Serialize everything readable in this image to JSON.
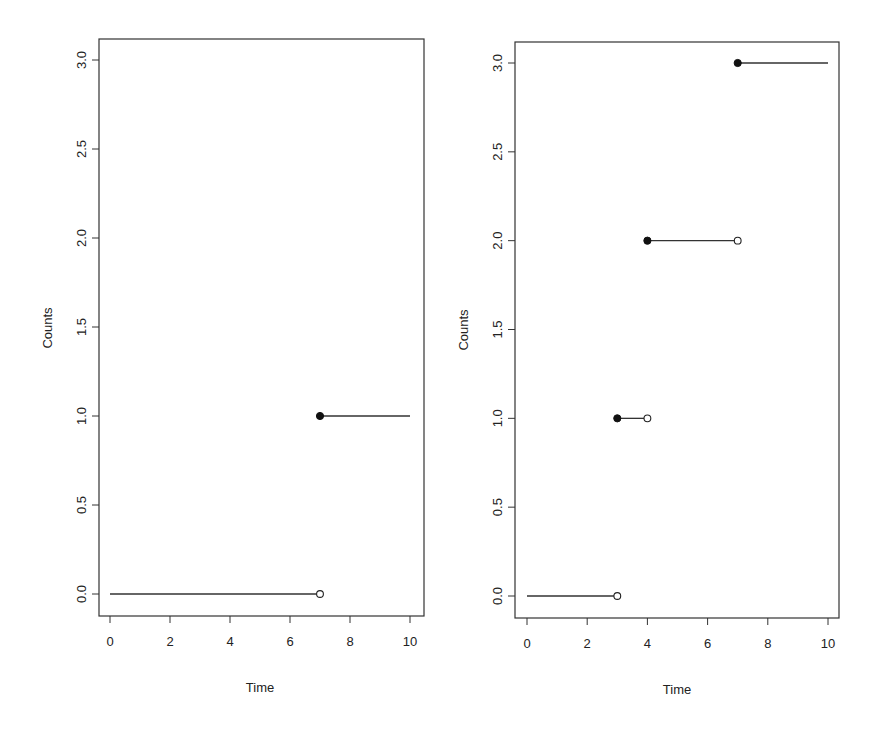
{
  "chart_data": [
    {
      "type": "line",
      "subtype": "step-function (counting process)",
      "title": "",
      "xlabel": "Time",
      "ylabel": "Counts",
      "xlim": [
        0,
        10
      ],
      "ylim": [
        0,
        3
      ],
      "x_ticks": [
        "0",
        "2",
        "4",
        "6",
        "8",
        "10"
      ],
      "y_ticks": [
        "0.0",
        "0.5",
        "1.0",
        "1.5",
        "2.0",
        "2.5",
        "3.0"
      ],
      "grid": false,
      "legend": null,
      "segments": [
        {
          "x_start": 0,
          "x_end": 7,
          "y": 0,
          "start_marker": "none",
          "end_marker": "open"
        },
        {
          "x_start": 7,
          "x_end": 10,
          "y": 1,
          "start_marker": "filled",
          "end_marker": "none"
        }
      ]
    },
    {
      "type": "line",
      "subtype": "step-function (counting process)",
      "title": "",
      "xlabel": "Time",
      "ylabel": "Counts",
      "xlim": [
        0,
        10
      ],
      "ylim": [
        0,
        3
      ],
      "x_ticks": [
        "0",
        "2",
        "4",
        "6",
        "8",
        "10"
      ],
      "y_ticks": [
        "0.0",
        "0.5",
        "1.0",
        "1.5",
        "2.0",
        "2.5",
        "3.0"
      ],
      "grid": false,
      "legend": null,
      "segments": [
        {
          "x_start": 0,
          "x_end": 3,
          "y": 0,
          "start_marker": "none",
          "end_marker": "open"
        },
        {
          "x_start": 3,
          "x_end": 4,
          "y": 1,
          "start_marker": "filled",
          "end_marker": "open"
        },
        {
          "x_start": 4,
          "x_end": 7,
          "y": 2,
          "start_marker": "filled",
          "end_marker": "open"
        },
        {
          "x_start": 7,
          "x_end": 10,
          "y": 3,
          "start_marker": "filled",
          "end_marker": "none"
        }
      ]
    }
  ],
  "panels": [
    {
      "xlabel": "Time",
      "ylabel": "Counts",
      "x_ticks": [
        "0",
        "2",
        "4",
        "6",
        "8",
        "10"
      ],
      "y_ticks": [
        "0.0",
        "0.5",
        "1.0",
        "1.5",
        "2.0",
        "2.5",
        "3.0"
      ]
    },
    {
      "xlabel": "Time",
      "ylabel": "Counts",
      "x_ticks": [
        "0",
        "2",
        "4",
        "6",
        "8",
        "10"
      ],
      "y_ticks": [
        "0.0",
        "0.5",
        "1.0",
        "1.5",
        "2.0",
        "2.5",
        "3.0"
      ]
    }
  ],
  "colors": {
    "line": "#333333",
    "frame": "#333333",
    "text": "#222222"
  }
}
